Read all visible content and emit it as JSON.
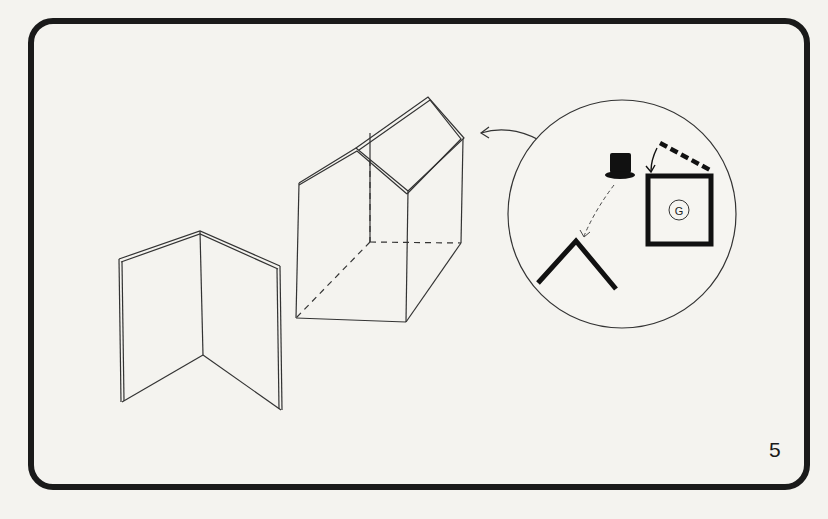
{
  "diagram": {
    "page_number": "5",
    "inset_label": "G",
    "colors": {
      "paper": "#f4f3ef",
      "ink": "#1a1a1a",
      "line": "#333333"
    },
    "elements": [
      "open-folded-panel",
      "house-shaped-box",
      "detail-inset-circle",
      "top-hat",
      "roof-chevron",
      "square-panel-with-G",
      "dashed-lid-edge"
    ]
  }
}
